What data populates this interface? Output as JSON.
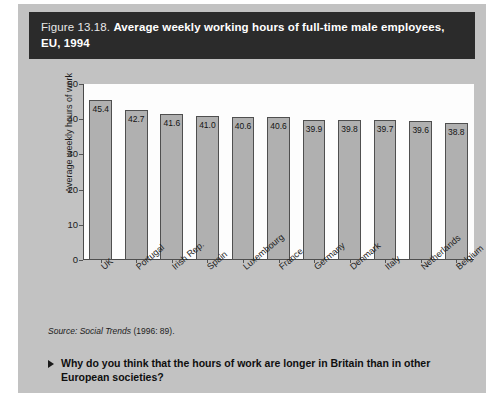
{
  "figure": {
    "number": "Figure 13.18.",
    "title": "Average weekly working hours of full-time male employees, EU, 1994"
  },
  "source": {
    "label": "Source:",
    "publication": "Social Trends",
    "citation": "(1996: 89)."
  },
  "question": {
    "bullet": "triangle-right-icon",
    "text": "Why do you think that the hours of work are longer in Britain than in other European societies?"
  },
  "colors": {
    "panel_background": "#c2c2c2",
    "title_bar": "#2b2b2b",
    "plot_background": "#fdfdfd",
    "bar_fill": "#b0b0b0",
    "bar_border": "#4f4f4f",
    "axis": "#4a4a4a"
  },
  "chart_data": {
    "type": "bar",
    "title": "Average weekly working hours of full-time male employees, EU, 1994",
    "xlabel": "",
    "ylabel": "Average weekly hours of work",
    "ylim": [
      0,
      50
    ],
    "yticks": [
      0,
      10,
      20,
      30,
      40,
      50
    ],
    "grid": false,
    "legend": "none",
    "categories": [
      "UK",
      "Portugal",
      "Irish Rep.",
      "Spain",
      "Luxembourg",
      "France",
      "Germany",
      "Denmark",
      "Italy",
      "Netherlands",
      "Belgium"
    ],
    "values": [
      45.4,
      42.7,
      41.6,
      41.0,
      40.6,
      40.6,
      39.9,
      39.8,
      39.7,
      39.6,
      38.8
    ],
    "value_labels": [
      "45.4",
      "42.7",
      "41.6",
      "41.0",
      "40.6",
      "40.6",
      "39.9",
      "39.8",
      "39.7",
      "39.6",
      "38.8"
    ]
  }
}
